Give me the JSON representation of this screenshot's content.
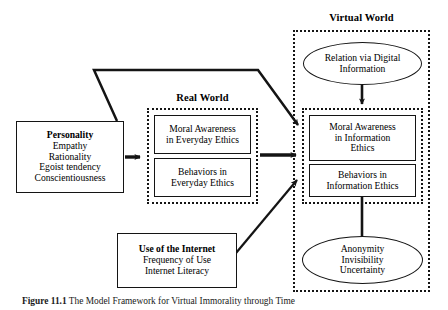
{
  "figure": {
    "caption_label": "Figure 11.1",
    "caption_text": "The Model Framework for Virtual Immorality through Time"
  },
  "groups": {
    "real_world": {
      "title": "Real World"
    },
    "virtual_world": {
      "title": "Virtual World"
    }
  },
  "nodes": {
    "personality": {
      "title": "Personality",
      "items": [
        "Empathy",
        "Rationality",
        "Egoist tendency",
        "Conscientiousness"
      ]
    },
    "internet_use": {
      "title": "Use of the Internet",
      "items": [
        "Frequency of Use",
        "Internet Literacy"
      ]
    },
    "moral_everyday": {
      "lines": [
        "Moral Awareness",
        "in Everyday Ethics"
      ]
    },
    "behaviors_everyday": {
      "lines": [
        "Behaviors in",
        "Everyday Ethics"
      ]
    },
    "moral_information": {
      "lines": [
        "Moral Awareness",
        "in Information",
        "Ethics"
      ]
    },
    "behaviors_information": {
      "lines": [
        "Behaviors in",
        "Information Ethics"
      ]
    },
    "relation_digital": {
      "lines": [
        "Relation via Digital",
        "Information"
      ]
    },
    "anonymity": {
      "lines": [
        "Anonymity",
        "Invisibility",
        "Uncertainty"
      ]
    }
  },
  "colors": {
    "stroke": "#141414",
    "background": "#ffffff"
  }
}
